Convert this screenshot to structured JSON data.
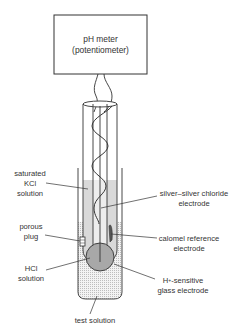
{
  "diagram": {
    "meter": {
      "line1": "pH meter",
      "line2": "(potentiometer)"
    },
    "labels": {
      "saturated_kcl": [
        "saturated",
        "KCl",
        "solution"
      ],
      "porous_plug": [
        "porous",
        "plug"
      ],
      "hcl_solution": [
        "HCl",
        "solution"
      ],
      "silver_chloride": [
        "silver–silver chloride",
        "electrode"
      ],
      "calomel": [
        "calomel reference",
        "electrode"
      ],
      "glass_electrode_prefix": "H",
      "glass_electrode_sup": "+",
      "glass_electrode_suffix": "-sensitive",
      "glass_electrode_line2": "glass electrode",
      "test_solution": "test solution"
    },
    "colors": {
      "line": "#333333",
      "kcl_fill": "#d9d9d9",
      "hcl_fill": "#a8a8a8",
      "test_solution_fill": "#eeeeee"
    }
  }
}
